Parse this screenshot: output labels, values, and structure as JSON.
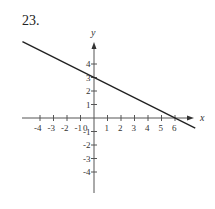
{
  "problem_number": "23.",
  "chart_data": {
    "type": "line",
    "title": "",
    "xlabel": "x",
    "ylabel": "y",
    "xlim": [
      -5,
      7
    ],
    "ylim": [
      -5,
      5
    ],
    "x_ticks": [
      -4,
      -3,
      -2,
      -1,
      0,
      1,
      2,
      3,
      4,
      5,
      6
    ],
    "y_ticks": [
      -4,
      -3,
      -2,
      -1,
      1,
      2,
      3,
      4
    ],
    "grid": false,
    "series": [
      {
        "name": "line",
        "x": [
          -5.3,
          7.5
        ],
        "y": [
          5.65,
          -0.75
        ],
        "equation": "y = -x/2 + 3",
        "y_intercept": 3,
        "x_intercept": 6
      }
    ]
  }
}
